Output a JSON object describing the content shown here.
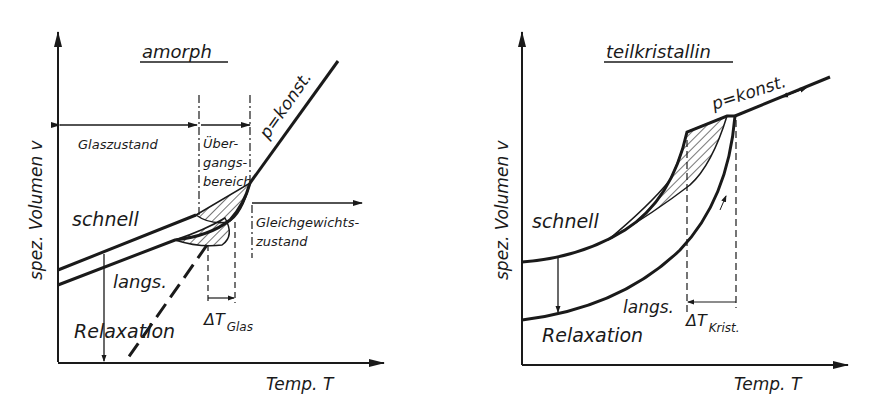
{
  "left_diagram": {
    "title": "amorph",
    "y_axis_label": "spez. Volumen v",
    "x_axis_label": "Temp. T",
    "line_label": "p=konst.",
    "region_glass": "Glaszustand",
    "region_transition_1": "Über-",
    "region_transition_2": "gangs-",
    "region_transition_3": "bereich",
    "region_equilibrium_1": "Gleichgewichts-",
    "region_equilibrium_2": "zustand",
    "fast_label": "schnell",
    "slow_label": "langs.",
    "relaxation_label": "Relaxation",
    "delta_label": "ΔT",
    "delta_sub": "Glas"
  },
  "right_diagram": {
    "title": "teilkristallin",
    "y_axis_label": "spez. Volumen v",
    "x_axis_label": "Temp. T",
    "line_label": "p=konst.",
    "fast_label": "schnell",
    "slow_label": "langs.",
    "relaxation_label": "Relaxation",
    "delta_label": "ΔT",
    "delta_sub": "Krist."
  },
  "colors": {
    "ink": "#1a1a1a",
    "background": "#ffffff"
  }
}
